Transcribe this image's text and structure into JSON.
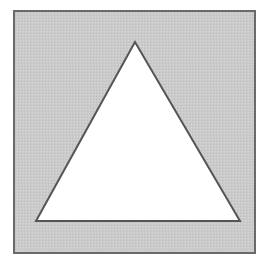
{
  "diagram": {
    "type": "shape",
    "colors": {
      "background": "#ffffff",
      "square_fill": "#c8c8c8",
      "square_stroke": "#6a6a6a",
      "triangle_fill": "#ffffff",
      "triangle_stroke": "#555555"
    },
    "square": {
      "x": 14,
      "y": 11,
      "width": 241,
      "height": 242
    },
    "triangle": {
      "points": "135,42 36,221 240,221"
    }
  }
}
